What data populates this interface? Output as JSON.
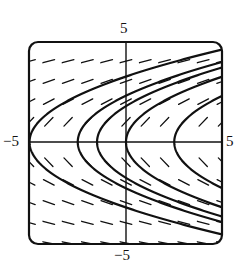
{
  "chart_data": {
    "type": "line",
    "subtype": "slope-field-with-solution-curves",
    "title": "",
    "xlabel": "",
    "ylabel": "",
    "xlim": [
      -5,
      5
    ],
    "ylim": [
      -5,
      5
    ],
    "grid": false,
    "legend": null,
    "tick_labels": {
      "top": "5",
      "bottom": "−5",
      "left": "−5",
      "right": "5"
    },
    "slope_field": {
      "equation": "dy/dx = 1/y",
      "x_points": [
        -5,
        -4,
        -3,
        -2,
        -1,
        0,
        1,
        2,
        3,
        4,
        5
      ],
      "y_points": [
        -5,
        -4,
        -3,
        -2,
        -1,
        1,
        2,
        3,
        4,
        5
      ],
      "segment_length_px": 12
    },
    "series": [
      {
        "name": "solution C=-5",
        "form": "x = y^2/2.1 + C",
        "C": -5,
        "vertex": [
          -5,
          0
        ]
      },
      {
        "name": "solution C=-2.5",
        "form": "x = y^2/2.1 + C",
        "C": -2.5,
        "vertex": [
          -2.5,
          0
        ]
      },
      {
        "name": "solution C=-1.5",
        "form": "x = y^2/2.1 + C",
        "C": -1.5,
        "vertex": [
          -1.5,
          0
        ]
      },
      {
        "name": "solution C=0",
        "form": "x = y^2/2.1 + C",
        "C": 0,
        "vertex": [
          0,
          0
        ]
      },
      {
        "name": "solution C=2.5",
        "form": "x = y^2/2.1 + C",
        "C": 2.5,
        "vertex": [
          2.5,
          0
        ]
      }
    ],
    "curve_k": 2.1,
    "colors": {
      "ink": "#111111",
      "background": "#ffffff"
    }
  },
  "layout": {
    "box": {
      "left": 29,
      "top": 42,
      "right": 222,
      "bottom": 244,
      "corner_radius": 9
    },
    "origin_px": [
      126,
      142
    ],
    "px_per_unit_x": 19.3,
    "px_per_unit_y": 20.2
  }
}
